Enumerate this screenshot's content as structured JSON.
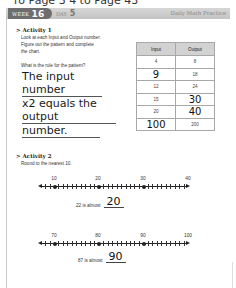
{
  "header": {
    "top_cut_text": "ro Page 3 4 to Page 43",
    "week_label": "WEEK",
    "week_number": "16",
    "day_label": "DAY",
    "day_number": "5",
    "practice_title": "Daily Math Practice"
  },
  "activity1": {
    "title": "Activity 1",
    "instructions": [
      "Look at each Input and Output number.",
      "Figure out the pattern and complete",
      "the chart."
    ],
    "question": "What is the rule for the pattern?",
    "answer_lines": [
      "The input number",
      "x2 equals the output",
      "number."
    ],
    "table": {
      "headers": [
        "Input",
        "Output"
      ],
      "rows": [
        {
          "input": "4",
          "output": "8"
        },
        {
          "input": "9",
          "output": "18"
        },
        {
          "input": "12",
          "output": "24"
        },
        {
          "input": "15",
          "output": "30"
        },
        {
          "input": "20",
          "output": "40"
        },
        {
          "input": "100",
          "output": "200"
        }
      ]
    }
  },
  "activity2": {
    "title": "Activity 2",
    "instructions": "Round to the nearest 10.",
    "number_lines": [
      {
        "labels": [
          "10",
          "20",
          "30",
          "40"
        ],
        "prompt": "22 is almost",
        "answer": "20"
      },
      {
        "labels": [
          "70",
          "80",
          "90",
          "100"
        ],
        "prompt": "87 is almost",
        "answer": "90"
      }
    ]
  }
}
